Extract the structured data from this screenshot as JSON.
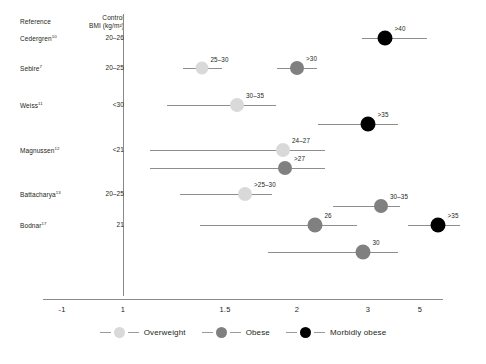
{
  "header": {
    "reference_label": "Reference",
    "control_label_line1": "Control",
    "control_label_line2": "BMI (kg/m²)"
  },
  "legend": {
    "position": "bottom-center",
    "items": [
      {
        "label": "Overweight",
        "color": "#d9d9d9"
      },
      {
        "label": "Obese",
        "color": "#808080"
      },
      {
        "label": "Morbidly obese",
        "color": "#000000"
      }
    ]
  },
  "colors": {
    "overweight": "#d9d9d9",
    "obese": "#808080",
    "morbidly_obese": "#000000",
    "line": "#8e8e8e",
    "axis": "#8a8a8a",
    "text": "#231f20"
  },
  "chart_data": {
    "type": "scatter",
    "title": "",
    "xlabel": "",
    "ylabel": "",
    "grid": false,
    "reference_line_x": 1,
    "xticks": [
      -1,
      1,
      1.5,
      2,
      3,
      5
    ],
    "xtick_labels": [
      "-1",
      "1",
      "1.5",
      "2",
      "3",
      "5"
    ],
    "xtick_px": [
      62,
      123,
      225,
      297,
      368,
      420
    ],
    "axis_scale": "non-linear (compressed above 1.5)",
    "rows": [
      {
        "reference": "Cedergren",
        "reference_sup": "10",
        "control_bmi": "20–26",
        "y": 38,
        "points": [
          {
            "label": ">40",
            "category": "morbidly_obese",
            "estimate_px": 385,
            "ci_low_px": 362,
            "ci_high_px": 427,
            "radius": 7.5
          }
        ]
      },
      {
        "reference": "Sebire",
        "reference_sup": "7",
        "control_bmi": "20–25",
        "y": 68,
        "points": [
          {
            "label": "25–30",
            "category": "overweight",
            "estimate_px": 202,
            "ci_low_px": 183,
            "ci_high_px": 222,
            "radius": 6.5
          },
          {
            "label": ">30",
            "category": "obese",
            "estimate_px": 297,
            "ci_low_px": 277,
            "ci_high_px": 317,
            "radius": 7.0
          }
        ]
      },
      {
        "reference": "Weiss",
        "reference_sup": "11",
        "control_bmi": "<30",
        "y": 105,
        "points": [
          {
            "label": "30–35",
            "category": "overweight",
            "estimate_px": 237,
            "ci_low_px": 167,
            "ci_high_px": 276,
            "radius": 7.0
          }
        ]
      },
      {
        "reference": "",
        "reference_sup": "",
        "control_bmi": "",
        "y": 124,
        "points": [
          {
            "label": ">35",
            "category": "morbidly_obese",
            "estimate_px": 368,
            "ci_low_px": 318,
            "ci_high_px": 398,
            "radius": 7.5
          }
        ]
      },
      {
        "reference": "Magnussen",
        "reference_sup": "12",
        "control_bmi": "<21",
        "y": 150,
        "points": [
          {
            "label": "24–27",
            "category": "overweight",
            "estimate_px": 283,
            "ci_low_px": 150,
            "ci_high_px": 325,
            "radius": 7.0
          }
        ]
      },
      {
        "reference": "",
        "reference_sup": "",
        "control_bmi": "",
        "y": 168,
        "points": [
          {
            "label": ">27",
            "category": "obese",
            "estimate_px": 285,
            "ci_low_px": 150,
            "ci_high_px": 325,
            "radius": 7.0
          }
        ]
      },
      {
        "reference": "Battacharya",
        "reference_sup": "13",
        "control_bmi": "20–25",
        "y": 194,
        "points": [
          {
            "label": ">25–30",
            "category": "overweight",
            "estimate_px": 245,
            "ci_low_px": 180,
            "ci_high_px": 272,
            "radius": 7.0
          }
        ]
      },
      {
        "reference": "",
        "reference_sup": "",
        "control_bmi": "",
        "y": 206,
        "points": [
          {
            "label": "30–35",
            "category": "obese",
            "estimate_px": 381,
            "ci_low_px": 333,
            "ci_high_px": 400,
            "radius": 7.0
          }
        ]
      },
      {
        "reference": "Bodnar",
        "reference_sup": "17",
        "control_bmi": "21",
        "y": 225,
        "points": [
          {
            "label": "26",
            "category": "obese",
            "estimate_px": 315,
            "ci_low_px": 200,
            "ci_high_px": 357,
            "radius": 7.5
          },
          {
            "label": ">35",
            "category": "morbidly_obese",
            "estimate_px": 438,
            "ci_low_px": 408,
            "ci_high_px": 460,
            "radius": 7.5
          }
        ]
      },
      {
        "reference": "",
        "reference_sup": "",
        "control_bmi": "",
        "y": 252,
        "points": [
          {
            "label": "30",
            "category": "obese",
            "estimate_px": 363,
            "ci_low_px": 268,
            "ci_high_px": 398,
            "radius": 7.5
          }
        ]
      }
    ]
  }
}
